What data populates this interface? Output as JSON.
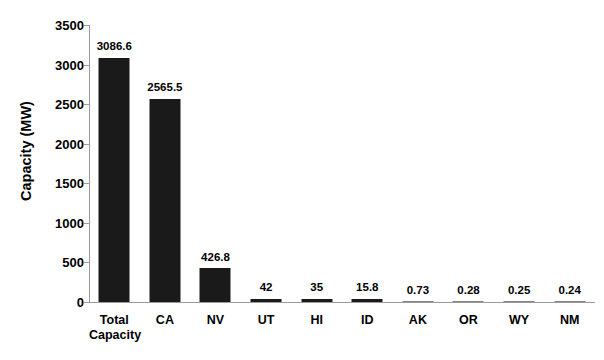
{
  "chart_data": {
    "type": "bar",
    "title": "",
    "subtitle": "",
    "xlabel": "",
    "ylabel": "Capacity (MW)",
    "ylim": [
      0,
      3500
    ],
    "yticks": [
      0,
      500,
      1000,
      1500,
      2000,
      2500,
      3000,
      3500
    ],
    "ytick_labels": [
      "0",
      "500",
      "1000",
      "1500",
      "2000",
      "2500",
      "3000",
      "3500"
    ],
    "grid": false,
    "legend": false,
    "legend_position": "none",
    "bar_color": "#1a1a1a",
    "axis_color": "#9b9b9b",
    "background_color": "#ffffff",
    "categories": [
      "Total Capacity",
      "CA",
      "NV",
      "UT",
      "HI",
      "ID",
      "AK",
      "OR",
      "WY",
      "NM"
    ],
    "values": [
      3086.6,
      2565.5,
      426.8,
      42,
      35,
      15.8,
      0.73,
      0.28,
      0.25,
      0.24
    ],
    "value_labels": [
      "3086.6",
      "2565.5",
      "426.8",
      "42",
      "35",
      "15.8",
      "0.73",
      "0.28",
      "0.25",
      "0.24"
    ],
    "bars": [
      {
        "category": "Total Capacity",
        "category_display": "Total\nCapacity",
        "value": 3086.6,
        "label": "3086.6"
      },
      {
        "category": "CA",
        "category_display": "CA",
        "value": 2565.5,
        "label": "2565.5"
      },
      {
        "category": "NV",
        "category_display": "NV",
        "value": 426.8,
        "label": "426.8"
      },
      {
        "category": "UT",
        "category_display": "UT",
        "value": 42,
        "label": "42"
      },
      {
        "category": "HI",
        "category_display": "HI",
        "value": 35,
        "label": "35"
      },
      {
        "category": "ID",
        "category_display": "ID",
        "value": 15.8,
        "label": "15.8"
      },
      {
        "category": "AK",
        "category_display": "AK",
        "value": 0.73,
        "label": "0.73"
      },
      {
        "category": "OR",
        "category_display": "OR",
        "value": 0.28,
        "label": "0.28"
      },
      {
        "category": "WY",
        "category_display": "WY",
        "value": 0.25,
        "label": "0.25"
      },
      {
        "category": "NM",
        "category_display": "NM",
        "value": 0.24,
        "label": "0.24"
      }
    ]
  }
}
